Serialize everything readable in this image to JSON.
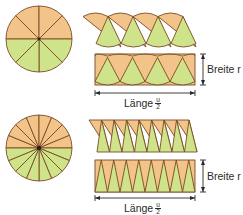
{
  "colors": {
    "orange": "#F2C48A",
    "green": "#CFE38A",
    "stroke": "#7A4A24",
    "arrow": "#2a2a2a"
  },
  "figures": [
    {
      "name": "circle-8-sectors",
      "sectors": 8,
      "circle": {
        "cx": 39,
        "cy": 39,
        "r": 33
      },
      "strip_parallelogram": {
        "top_y": 13,
        "bottom_y": 47,
        "top_x0": 83,
        "bottom_x0": 96,
        "width": 100
      },
      "strip_rectangle": {
        "top_y": 54,
        "bottom_y": 85,
        "x0": 95,
        "x1": 195
      },
      "length_arrow_y": 93,
      "width_arrow_x": 203,
      "length_label": {
        "text": "Länge",
        "num": "u",
        "den": "2"
      },
      "width_label": "Breite r"
    },
    {
      "name": "circle-16-sectors",
      "sectors": 16,
      "circle": {
        "cx": 39,
        "cy": 148,
        "r": 33
      },
      "strip_parallelogram": {
        "top_y": 120,
        "bottom_y": 152,
        "top_x0": 89,
        "bottom_x0": 97,
        "width": 100
      },
      "strip_rectangle": {
        "top_y": 160,
        "bottom_y": 192,
        "x0": 95,
        "x1": 195
      },
      "length_arrow_y": 198,
      "width_arrow_x": 203,
      "length_label": {
        "text": "Länge",
        "num": "u",
        "den": "2"
      },
      "width_label": "Breite r"
    }
  ]
}
